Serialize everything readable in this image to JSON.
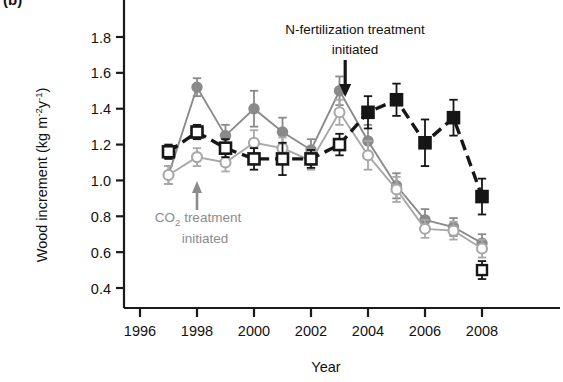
{
  "panel": {
    "label": "(b)"
  },
  "axes": {
    "ylabel_main": "Wood increment (kg m",
    "ylabel_sup1": "-2",
    "ylabel_mid": "y",
    "ylabel_sup2": "-1",
    "ylabel_end": ")",
    "xlabel": "Year",
    "yticks": [
      "0.4",
      "0.6",
      "0.8",
      "1.0",
      "1.2",
      "1.4",
      "1.6",
      "1.8"
    ],
    "xticks": [
      "1996",
      "1998",
      "2000",
      "2002",
      "2004",
      "2006",
      "2008"
    ]
  },
  "annotations": {
    "n_fert_line1": "N-fertilization treatment",
    "n_fert_line2": "initiated",
    "co2_line1_a": "CO",
    "co2_line1_sub": "2",
    "co2_line1_b": " treatment",
    "co2_line2": "initiated"
  },
  "colors": {
    "black": "#161616",
    "gray_dark": "#8a8a8a",
    "gray_light": "#a8a8a8",
    "axis": "#1a1a1a",
    "co2_text": "#8c8c8c"
  },
  "chart_data": {
    "type": "line",
    "title": "",
    "xlabel": "Year",
    "ylabel": "Wood increment (kg m-2 y-1)",
    "xlim": [
      1995.6,
      2008.9
    ],
    "ylim": [
      0.33,
      1.92
    ],
    "grid": false,
    "legend_position": "none",
    "x": [
      1997,
      1998,
      1999,
      2000,
      2001,
      2002,
      2003,
      2004,
      2005,
      2006,
      2007,
      2008
    ],
    "series": [
      {
        "name": "elevated-CO2-filled-gray-circle",
        "marker": "filled-circle",
        "color": "#8a8a8a",
        "linestyle": "solid",
        "values": [
          1.03,
          1.52,
          1.25,
          1.4,
          1.27,
          1.17,
          1.5,
          1.22,
          0.97,
          0.78,
          0.74,
          0.65
        ],
        "errors": [
          0.05,
          0.05,
          0.06,
          0.1,
          0.08,
          0.06,
          0.08,
          0.09,
          0.07,
          0.06,
          0.05,
          0.05
        ]
      },
      {
        "name": "ambient-open-gray-circle",
        "marker": "open-circle",
        "color": "#a8a8a8",
        "linestyle": "solid",
        "values": [
          1.03,
          1.13,
          1.1,
          1.21,
          1.18,
          1.11,
          1.38,
          1.14,
          0.95,
          0.73,
          0.72,
          0.62
        ],
        "errors": [
          0.05,
          0.05,
          0.05,
          0.07,
          0.06,
          0.05,
          0.07,
          0.08,
          0.07,
          0.05,
          0.05,
          0.05
        ]
      },
      {
        "name": "N-fertilized-black-square",
        "marker": "mixed-square",
        "color": "#161616",
        "linestyle": "dashed",
        "values": [
          1.16,
          1.27,
          1.18,
          1.12,
          1.12,
          1.12,
          1.2,
          1.38,
          1.45,
          1.21,
          1.35,
          0.91
        ],
        "errors": [
          0.04,
          0.04,
          0.05,
          0.06,
          0.09,
          0.05,
          0.06,
          0.09,
          0.09,
          0.13,
          0.1,
          0.1
        ],
        "filled_from_year": 2004
      },
      {
        "name": "control-black-open-square-2008",
        "marker": "open-square",
        "color": "#161616",
        "linestyle": "dashed",
        "values": [
          null,
          null,
          null,
          null,
          null,
          null,
          null,
          null,
          null,
          null,
          null,
          0.5
        ],
        "errors": [
          null,
          null,
          null,
          null,
          null,
          null,
          null,
          null,
          null,
          null,
          null,
          0.05
        ]
      }
    ],
    "event_markers": [
      {
        "label": "CO2 treatment initiated",
        "year": 1998,
        "direction": "up"
      },
      {
        "label": "N-fertilization treatment initiated",
        "year": 2003.2,
        "direction": "down"
      }
    ]
  }
}
